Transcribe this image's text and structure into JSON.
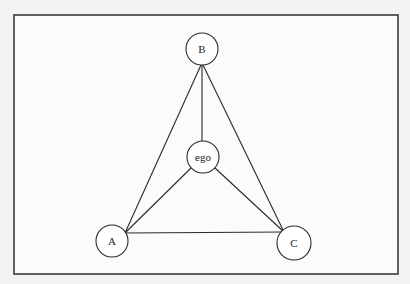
{
  "diagram": {
    "type": "network-graph",
    "frame": {
      "x": 14,
      "y": 15,
      "width": 384,
      "height": 259
    },
    "colors": {
      "background": "#f3f3f1",
      "frame_fill": "#fbfbfa",
      "stroke": "#2a2a2a",
      "node_fill": "#ffffff"
    },
    "nodes": [
      {
        "id": "B",
        "label": "B",
        "cx": 202,
        "cy": 49,
        "r": 16
      },
      {
        "id": "ego",
        "label": "ego",
        "cx": 203,
        "cy": 157,
        "r": 16
      },
      {
        "id": "A",
        "label": "A",
        "cx": 112,
        "cy": 241,
        "r": 16
      },
      {
        "id": "C",
        "label": "C",
        "cx": 294,
        "cy": 243,
        "r": 17
      }
    ],
    "edges": [
      {
        "from": "B",
        "to": "ego",
        "x1": 202,
        "y1": 65,
        "x2": 202,
        "y2": 141
      },
      {
        "from": "B",
        "to": "A",
        "x1": 201,
        "y1": 65,
        "x2": 125,
        "y2": 233
      },
      {
        "from": "B",
        "to": "C",
        "x1": 203,
        "y1": 65,
        "x2": 284,
        "y2": 232
      },
      {
        "from": "ego",
        "to": "A",
        "x1": 191,
        "y1": 168,
        "x2": 125,
        "y2": 233
      },
      {
        "from": "ego",
        "to": "C",
        "x1": 215,
        "y1": 168,
        "x2": 284,
        "y2": 232
      },
      {
        "from": "A",
        "to": "C",
        "x1": 125,
        "y1": 233,
        "x2": 284,
        "y2": 232
      }
    ]
  }
}
